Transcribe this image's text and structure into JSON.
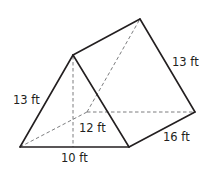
{
  "diagram": {
    "type": "triangular-prism",
    "labels": {
      "front_slant": "13 ft",
      "back_slant": "13 ft",
      "height": "12 ft",
      "base": "10 ft",
      "length": "16 ft"
    }
  }
}
